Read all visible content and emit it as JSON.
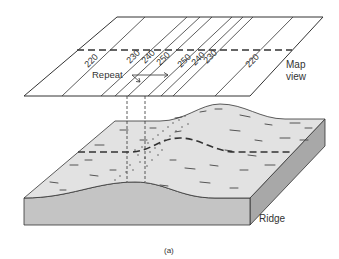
{
  "figure": {
    "caption": "(a)",
    "map_view_label": [
      "Map",
      "view"
    ],
    "repeat_label": "Repeat",
    "ridge_label": "Ridge",
    "contours": [
      {
        "label": "220",
        "x": 88
      },
      {
        "label": "230",
        "x": 130
      },
      {
        "label": "240",
        "x": 145
      },
      {
        "label": "250",
        "x": 160
      },
      {
        "label": "250",
        "x": 181
      },
      {
        "label": "240",
        "x": 195
      },
      {
        "label": "230",
        "x": 207
      },
      {
        "label": "220",
        "x": 250
      }
    ],
    "colors": {
      "line": "#333333",
      "surface": "#e2e2e2",
      "front_face": "#c4c4c4",
      "side_face": "#a8a8a8",
      "background": "#ffffff"
    }
  }
}
